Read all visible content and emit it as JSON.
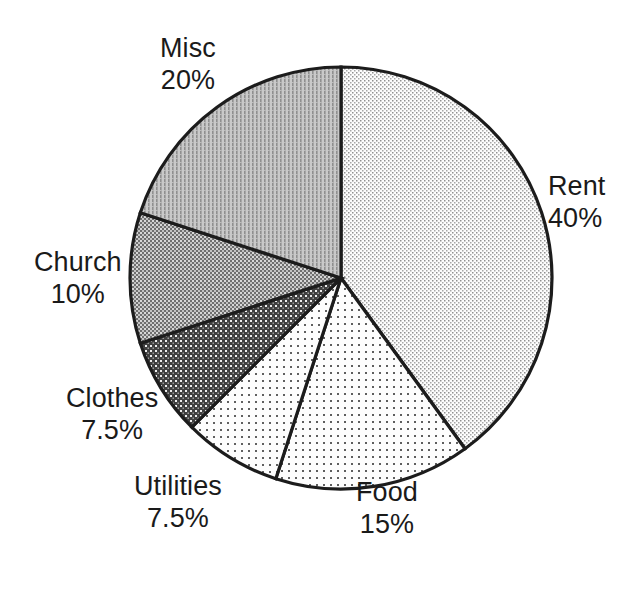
{
  "chart_data": {
    "type": "pie",
    "title": "",
    "subtitle": "",
    "xlabel": "",
    "ylabel": "",
    "legend_position": "none",
    "grid": false,
    "labels_on_slices": false,
    "start_angle_deg": 0,
    "direction": "clockwise",
    "total_percent": 100,
    "categories": [
      "Rent",
      "Food",
      "Utilities",
      "Clothes",
      "Church",
      "Misc"
    ],
    "values": [
      40,
      15,
      7.5,
      7.5,
      10,
      20
    ],
    "slices": [
      {
        "name": "Rent",
        "value": 40,
        "value_label": "40%",
        "start_deg": 0,
        "end_deg": 144,
        "fill_pattern": "fine-dots-very-light",
        "fill_color": "#f2f2f2",
        "dot_color": "#8d8d8d",
        "label_align": "left"
      },
      {
        "name": "Food",
        "value": 15,
        "value_label": "15%",
        "start_deg": 144,
        "end_deg": 198,
        "fill_pattern": "sparse-dots-light",
        "fill_color": "#fafafa",
        "dot_color": "#6f6f6f",
        "label_align": "center"
      },
      {
        "name": "Utilities",
        "value": 7.5,
        "value_label": "7.5%",
        "start_deg": 198,
        "end_deg": 225,
        "fill_pattern": "sparse-dots-light",
        "fill_color": "#fbfbfb",
        "dot_color": "#707070",
        "label_align": "center"
      },
      {
        "name": "Clothes",
        "value": 7.5,
        "value_label": "7.5%",
        "start_deg": 225,
        "end_deg": 252,
        "fill_pattern": "dark-grid-white-dots",
        "fill_color": "#4a4a4a",
        "dot_color": "#e8e8e8",
        "label_align": "center"
      },
      {
        "name": "Church",
        "value": 10,
        "value_label": "10%",
        "start_deg": 252,
        "end_deg": 288,
        "fill_pattern": "mid-checker",
        "fill_color": "#8a8a8a",
        "dot_color": "#dcdcdc",
        "label_align": "center"
      },
      {
        "name": "Misc",
        "value": 20,
        "value_label": "20%",
        "start_deg": 288,
        "end_deg": 360,
        "fill_pattern": "vertical-hatch-mid",
        "fill_color": "#b7b7b7",
        "dot_color": "#9a9a9a",
        "label_align": "center"
      }
    ],
    "colors": {
      "outline": "#1c1c1c",
      "background": "#ffffff",
      "text": "#1a1a1a"
    }
  },
  "labels": {
    "rent": {
      "name": "Rent",
      "value": "40%"
    },
    "food": {
      "name": "Food",
      "value": "15%"
    },
    "utilities": {
      "name": "Utilities",
      "value": "7.5%"
    },
    "clothes": {
      "name": "Clothes",
      "value": "7.5%"
    },
    "church": {
      "name": "Church",
      "value": "10%"
    },
    "misc": {
      "name": "Misc",
      "value": "20%"
    }
  }
}
